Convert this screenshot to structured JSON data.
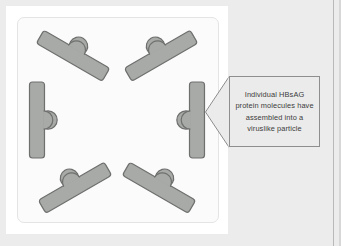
{
  "figure": {
    "panel_background": "#fbfbfb",
    "canvas_background": "#ececed",
    "subunit_fill": "#a8aaa8",
    "subunit_stroke": "#6e706e",
    "callout_fill": "#ebebeb",
    "callout_stroke": "#8e8e8e"
  },
  "callout": {
    "text": "Individual HBsAG protein molecules have assembled into a viruslike particle",
    "lines": [
      "Individual HBsAG",
      "protein molecules",
      "have assembled",
      "into a viruslike",
      "particle"
    ],
    "pointer_direction": "left"
  },
  "particle": {
    "shape": "hexagonal ring",
    "subunit_count": 6,
    "subunit_label": "HBsAG protein molecule",
    "subunits": [
      {
        "position": "top-left",
        "rotation_deg": 30,
        "knob_side": "outward"
      },
      {
        "position": "top-right",
        "rotation_deg": -30,
        "knob_side": "outward"
      },
      {
        "position": "right",
        "rotation_deg": 90,
        "knob_side": "outward"
      },
      {
        "position": "bottom-right",
        "rotation_deg": 30,
        "knob_side": "outward"
      },
      {
        "position": "bottom-left",
        "rotation_deg": -30,
        "knob_side": "outward"
      },
      {
        "position": "left",
        "rotation_deg": 90,
        "knob_side": "outward"
      }
    ]
  }
}
